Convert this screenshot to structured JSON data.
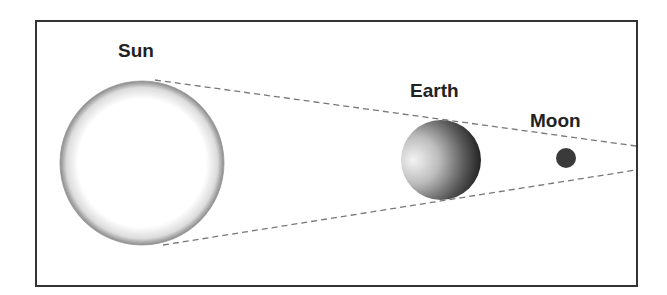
{
  "diagram": {
    "labels": {
      "sun": "Sun",
      "earth": "Earth",
      "moon": "Moon"
    },
    "bodies": [
      {
        "name": "Sun",
        "cx": 142,
        "cy": 163,
        "r": 82,
        "fill": "#ffffff",
        "edge": "#888888"
      },
      {
        "name": "Earth",
        "cx": 441,
        "cy": 160,
        "r": 40,
        "fill_light": "#f2f2f2",
        "fill_dark": "#1a1a1a"
      },
      {
        "name": "Moon",
        "cx": 566,
        "cy": 158,
        "r": 10,
        "fill": "#3a3a3a"
      }
    ],
    "lines": {
      "style": "dashed",
      "color": "#777777",
      "upper": {
        "x1": 155,
        "y1": 80,
        "x2": 636,
        "y2": 146
      },
      "lower": {
        "x1": 163,
        "y1": 245,
        "x2": 636,
        "y2": 170
      }
    },
    "frame_color": "#333333"
  }
}
